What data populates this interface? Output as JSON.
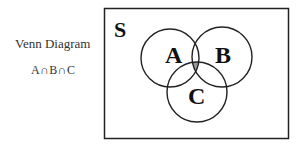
{
  "caption": {
    "title": "Venn Diagram",
    "expression": "A∩B∩C"
  },
  "diagram": {
    "universe_label": "S",
    "sets": [
      {
        "label": "A",
        "cx": 170,
        "cy": 58,
        "r": 29
      },
      {
        "label": "B",
        "cx": 222,
        "cy": 57,
        "r": 30
      },
      {
        "label": "C",
        "cx": 197,
        "cy": 92,
        "r": 30
      }
    ],
    "shaded_region": "A∩B∩C",
    "shade_color": "#999999",
    "stroke_color": "#222222"
  }
}
